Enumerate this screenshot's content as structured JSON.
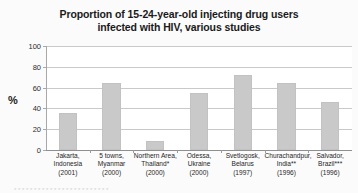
{
  "figure": {
    "background_color": "#fbfbfb",
    "plot_background_color": "#ffffff",
    "bar_color": "#c9c9c9",
    "grid_color": "#c9c9c9",
    "axis_color": "#8f8f8f"
  },
  "title": {
    "line1": "Proportion of 15-24-year-old injecting drug users",
    "line2": "infected with HIV, various studies"
  },
  "axes": {
    "y_title": "%",
    "y_ticks": [
      "100",
      "80",
      "60",
      "40",
      "20",
      "0"
    ]
  },
  "footnote": {
    "text": "* * *   * * * * *     * *   * * * * *        * * * * *  * *            * *"
  },
  "chart_data": {
    "type": "bar",
    "title": "Proportion of 15-24-year-old injecting drug users infected with HIV, various studies",
    "xlabel": "",
    "ylabel": "%",
    "ylim": [
      0,
      100
    ],
    "yticks": [
      0,
      20,
      40,
      60,
      80,
      100
    ],
    "grid": true,
    "legend": "none",
    "categories": [
      "Jakarta, Indonesia (2001)",
      "5 towns, Myanmar (2000)",
      "Northern Area, Thailand* (2000)",
      "Odessa, Ukraine (2000)",
      "Svetlogosk, Belarus (1997)",
      "Churachandpur, India** (1996)",
      "Salvador, Brazil*** (1996)"
    ],
    "category_lines": [
      [
        "Jakarta,",
        "Indonesia",
        "(2001)"
      ],
      [
        "5 towns,",
        "Myanmar",
        "(2000)"
      ],
      [
        "Northern Area,",
        "Thailand*",
        "(2000)"
      ],
      [
        "Odessa,",
        "Ukraine",
        "(2000)"
      ],
      [
        "Svetlogosk,",
        "Belarus",
        "(1997)"
      ],
      [
        "Churachandpur,",
        "India**",
        "(1996)"
      ],
      [
        "Salvador,",
        "Brazil***",
        "(1996)"
      ]
    ],
    "values": [
      36,
      64,
      9,
      55,
      72,
      64,
      46
    ],
    "series": [
      {
        "name": "HIV prevalence among 15-24-year-old injecting drug users",
        "values": [
          36,
          64,
          9,
          55,
          72,
          64,
          46
        ]
      }
    ]
  }
}
